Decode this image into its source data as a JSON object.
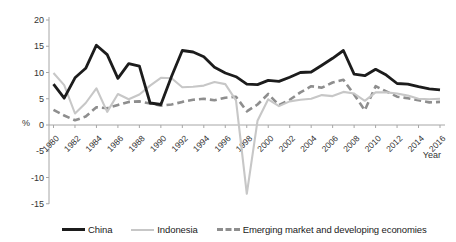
{
  "chart_data": {
    "type": "line",
    "title": "",
    "xlabel": "Year",
    "ylabel": "%",
    "ylim": [
      -15,
      20
    ],
    "grid": false,
    "legend_position": "bottom",
    "axis_color": "#a6a6a6",
    "text_color": "#333333",
    "yticks": [
      20,
      15,
      10,
      5,
      0,
      -5,
      -10,
      -15
    ],
    "xticks": [
      1980,
      1982,
      1984,
      1986,
      1988,
      1990,
      1992,
      1994,
      1996,
      1998,
      2000,
      2002,
      2004,
      2006,
      2008,
      2010,
      2012,
      2014,
      2016
    ],
    "x": [
      1980,
      1981,
      1982,
      1983,
      1984,
      1985,
      1986,
      1987,
      1988,
      1989,
      1990,
      1991,
      1992,
      1993,
      1994,
      1995,
      1996,
      1997,
      1998,
      1999,
      2000,
      2001,
      2002,
      2003,
      2004,
      2005,
      2006,
      2007,
      2008,
      2009,
      2010,
      2011,
      2012,
      2013,
      2014,
      2015,
      2016
    ],
    "series": [
      {
        "name": "China",
        "color": "#1c1c1c",
        "line_style": "solid",
        "line_width": 2.8,
        "values": [
          7.8,
          5.1,
          9.0,
          10.8,
          15.2,
          13.4,
          8.9,
          11.7,
          11.2,
          4.2,
          3.9,
          9.3,
          14.2,
          13.9,
          13.0,
          11.0,
          9.9,
          9.2,
          7.8,
          7.7,
          8.5,
          8.3,
          9.1,
          10.0,
          10.1,
          11.4,
          12.7,
          14.2,
          9.7,
          9.4,
          10.6,
          9.5,
          7.9,
          7.8,
          7.3,
          6.9,
          6.7
        ]
      },
      {
        "name": "Indonesia",
        "color": "#c7c7c7",
        "line_style": "solid",
        "line_width": 2.1,
        "values": [
          9.9,
          7.6,
          2.2,
          4.2,
          7.0,
          2.5,
          5.9,
          4.9,
          5.8,
          7.5,
          9.0,
          8.9,
          7.2,
          7.3,
          7.5,
          8.2,
          7.8,
          4.7,
          -13.1,
          0.8,
          4.9,
          3.6,
          4.5,
          4.8,
          5.0,
          5.7,
          5.5,
          6.3,
          6.0,
          4.6,
          6.2,
          6.2,
          6.0,
          5.6,
          5.0,
          4.9,
          5.0
        ]
      },
      {
        "name": "Emerging market and developing economies",
        "color": "#8e8e8e",
        "line_style": "dashed",
        "line_width": 2.6,
        "values": [
          2.9,
          1.8,
          0.9,
          1.6,
          3.4,
          3.2,
          3.8,
          4.4,
          4.5,
          4.1,
          3.7,
          3.9,
          4.4,
          4.8,
          5.0,
          4.7,
          5.2,
          5.4,
          2.6,
          3.9,
          5.9,
          3.8,
          4.8,
          6.2,
          7.4,
          7.1,
          8.1,
          8.6,
          5.8,
          2.8,
          7.4,
          6.4,
          5.4,
          5.1,
          4.7,
          4.3,
          4.4
        ]
      }
    ]
  }
}
